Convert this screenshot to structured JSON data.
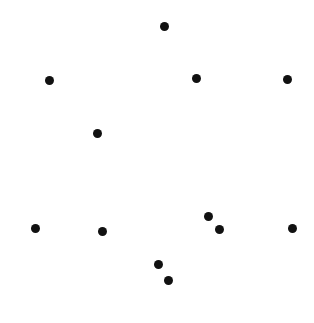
{
  "canvas": {
    "width": 314,
    "height": 323,
    "background": "#ffffff"
  },
  "dots": {
    "color": "#111111",
    "radius": 4.5,
    "points": [
      {
        "x": 164,
        "y": 26
      },
      {
        "x": 49,
        "y": 80
      },
      {
        "x": 196,
        "y": 78
      },
      {
        "x": 287,
        "y": 79
      },
      {
        "x": 97,
        "y": 133
      },
      {
        "x": 35,
        "y": 228
      },
      {
        "x": 102,
        "y": 231
      },
      {
        "x": 208,
        "y": 216
      },
      {
        "x": 219,
        "y": 229
      },
      {
        "x": 292,
        "y": 228
      },
      {
        "x": 158,
        "y": 264
      },
      {
        "x": 168,
        "y": 280
      }
    ]
  }
}
